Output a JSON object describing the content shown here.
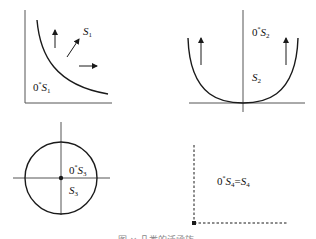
{
  "panels": [
    {
      "id": "S1",
      "shape": "hyperbola-curve",
      "labels": {
        "set_prefix": "0",
        "set_star": "*",
        "set_name": "S",
        "set_sub": "1",
        "region_name": "S",
        "region_sub": "1"
      }
    },
    {
      "id": "S2",
      "shape": "parabola-curve",
      "labels": {
        "set_prefix": "0",
        "set_star": "*",
        "set_name": "S",
        "set_sub": "2",
        "region_name": "S",
        "region_sub": "2"
      }
    },
    {
      "id": "S3",
      "shape": "circle",
      "labels": {
        "set_prefix": "0",
        "set_star": "*",
        "set_name": "S",
        "set_sub": "3",
        "region_name": "S",
        "region_sub": "3"
      }
    },
    {
      "id": "S4",
      "shape": "dashed-orthant",
      "labels": {
        "set_prefix": "0",
        "set_star": "*",
        "set_name": "S",
        "set_sub": "4",
        "eq": "=",
        "region_name": "S",
        "region_sub": "4"
      }
    }
  ],
  "caption": "图 ×  几类的泛函族",
  "colors": {
    "stroke": "#1a1a1a",
    "axis": "#555555",
    "caption": "#888888"
  }
}
